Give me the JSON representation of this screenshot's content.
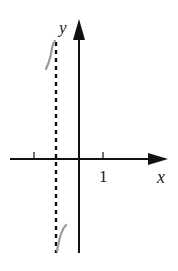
{
  "diagram": {
    "type": "function-graph-sketch",
    "axes": {
      "x_label": "x",
      "y_label": "y",
      "tick_label": "1",
      "axis_color": "#111111"
    },
    "asymptote": {
      "style": "dashed-vertical",
      "color": "#111111"
    },
    "curve": {
      "color": "#9a9a9a",
      "description": "two branches approaching vertical asymptote from the left, top and bottom"
    }
  }
}
